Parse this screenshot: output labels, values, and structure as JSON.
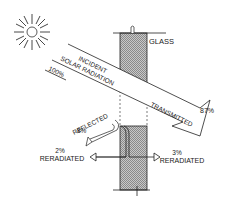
{
  "diagram": {
    "labels": {
      "glass": "GLASS",
      "incident_line1": "INCIDENT",
      "incident_line2": "SOLAR RADIATION",
      "incident_pct": "100%",
      "transmitted": "TRANSMITTED",
      "transmitted_pct": "87%",
      "reflected": "REFLECTED",
      "reflected_pct": "8%",
      "reradiated_out_pct": "2%",
      "reradiated_out": "RERADIATED",
      "reradiated_in_pct": "3%",
      "reradiated_in": "RERADIATED"
    },
    "icons": {
      "sun": "sun-icon"
    },
    "colors": {
      "ink": "#1a1a1a",
      "hatch": "#9a9a9a",
      "background": "#ffffff"
    }
  }
}
